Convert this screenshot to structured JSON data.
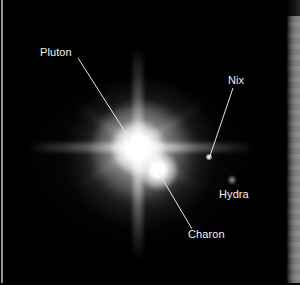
{
  "image": {
    "title": "Pluto system",
    "kind": "astronomical-photograph",
    "background_color": "#000000",
    "label_color": "#f2f2f2",
    "leader_line_color": "#e6e6e6",
    "width": 300,
    "height": 285
  },
  "annotations": [
    {
      "id": "pluton",
      "label": "Pluton",
      "label_x": 40,
      "label_y": 46,
      "leader": {
        "x1": 78,
        "y1": 58,
        "x2": 131,
        "y2": 141
      }
    },
    {
      "id": "nix",
      "label": "Nix",
      "label_x": 228,
      "label_y": 74,
      "leader": {
        "x1": 233,
        "y1": 88,
        "x2": 210,
        "y2": 156
      }
    },
    {
      "id": "hydra",
      "label": "Hydra",
      "label_x": 219,
      "label_y": 188,
      "leader": null
    },
    {
      "id": "charon",
      "label": "Charon",
      "label_x": 188,
      "label_y": 228,
      "leader": {
        "x1": 159,
        "y1": 173,
        "x2": 192,
        "y2": 229
      }
    }
  ],
  "bodies": [
    {
      "id": "pluto",
      "name": "Pluton",
      "x": 138,
      "y": 148,
      "brightness": "brightest"
    },
    {
      "id": "charon",
      "name": "Charon",
      "x": 158,
      "y": 170,
      "brightness": "bright"
    },
    {
      "id": "nix",
      "name": "Nix",
      "x": 209,
      "y": 157,
      "brightness": "faint"
    },
    {
      "id": "hydra",
      "name": "Hydra",
      "x": 232,
      "y": 180,
      "brightness": "very-faint"
    }
  ]
}
